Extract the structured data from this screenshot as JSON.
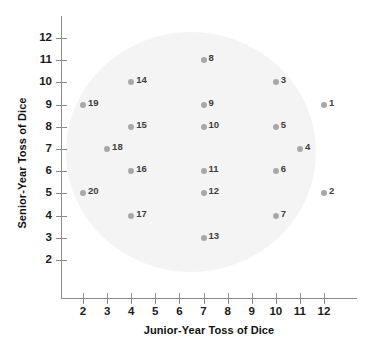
{
  "chart_data": {
    "type": "scatter",
    "title": "",
    "xlabel": "Junior-Year Toss of Dice",
    "ylabel": "Senior-Year Toss of Dice",
    "xlim": [
      1.4,
      12.8
    ],
    "ylim": [
      1.3,
      12.7
    ],
    "xticks": [
      2,
      3,
      4,
      5,
      6,
      7,
      8,
      9,
      10,
      11,
      12
    ],
    "yticks": [
      2,
      3,
      4,
      5,
      6,
      7,
      8,
      9,
      10,
      11,
      12
    ],
    "xticklabels": [
      "2",
      "3",
      "4",
      "5",
      "6",
      "7",
      "8",
      "9",
      "10",
      "11",
      "12"
    ],
    "yticklabels": [
      "2",
      "3",
      "4",
      "5",
      "6",
      "7",
      "8",
      "9",
      "10",
      "11",
      "12"
    ],
    "grid": false,
    "legend": false,
    "marker_color": "#a8a8a8",
    "label_color": "#3d3d3d",
    "background_shape": "ellipse",
    "background_color": "#f4f4f4",
    "points": [
      {
        "label": "1",
        "x": 12,
        "y": 9
      },
      {
        "label": "2",
        "x": 12,
        "y": 5
      },
      {
        "label": "3",
        "x": 10,
        "y": 10
      },
      {
        "label": "4",
        "x": 11,
        "y": 7
      },
      {
        "label": "5",
        "x": 10,
        "y": 8
      },
      {
        "label": "6",
        "x": 10,
        "y": 6
      },
      {
        "label": "7",
        "x": 10,
        "y": 4
      },
      {
        "label": "8",
        "x": 7,
        "y": 11
      },
      {
        "label": "9",
        "x": 7,
        "y": 9
      },
      {
        "label": "10",
        "x": 7,
        "y": 8
      },
      {
        "label": "11",
        "x": 7,
        "y": 6
      },
      {
        "label": "12",
        "x": 7,
        "y": 5
      },
      {
        "label": "13",
        "x": 7,
        "y": 3
      },
      {
        "label": "14",
        "x": 4,
        "y": 10
      },
      {
        "label": "15",
        "x": 4,
        "y": 8
      },
      {
        "label": "16",
        "x": 4,
        "y": 6
      },
      {
        "label": "17",
        "x": 4,
        "y": 4
      },
      {
        "label": "18",
        "x": 3,
        "y": 7
      },
      {
        "label": "19",
        "x": 2,
        "y": 9
      },
      {
        "label": "20",
        "x": 2,
        "y": 5
      }
    ]
  }
}
